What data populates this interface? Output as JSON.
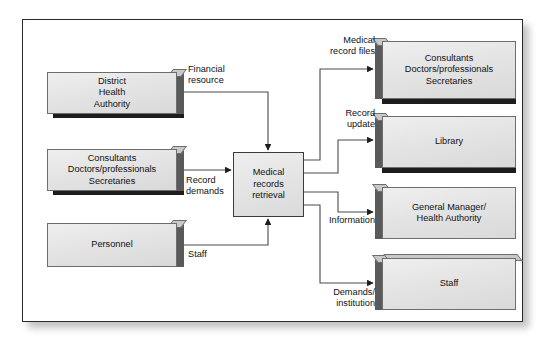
{
  "diagram": {
    "type": "data-flow-diagram",
    "frame": {
      "border_color": "#2b2b2b",
      "background": "#ffffff"
    },
    "palette": {
      "block_fill": "#e4e4e4",
      "block_border": "#6d6d6d",
      "block_shadow": "#1d1d1d",
      "block_side_shade": "#5a5a5a",
      "connector": "#3b3b3b",
      "text": "#111111"
    },
    "process": {
      "id": "medical-records-retrieval",
      "label": "Medical\nrecords\nretrieval",
      "shape": "rectangle"
    },
    "sources": [
      {
        "id": "district-health-authority",
        "label": "District\nHealth\nAuthority"
      },
      {
        "id": "consultants-doctors-secretaries-in",
        "label": "Consultants\nDoctors/professionals\nSecretaries"
      },
      {
        "id": "personnel",
        "label": "Personnel"
      }
    ],
    "sinks": [
      {
        "id": "consultants-doctors-secretaries-out",
        "label": "Consultants\nDoctors/professionals\nSecretaries"
      },
      {
        "id": "library",
        "label": "Library"
      },
      {
        "id": "general-manager-health-authority",
        "label": "General Manager/\nHealth Authority"
      },
      {
        "id": "staff",
        "label": "Staff"
      }
    ],
    "inflows": [
      {
        "id": "financial-resource",
        "label": "Financial\nresource",
        "from": "district-health-authority",
        "to": "medical-records-retrieval"
      },
      {
        "id": "record-demands",
        "label": "Record\ndemands",
        "from": "consultants-doctors-secretaries-in",
        "to": "medical-records-retrieval"
      },
      {
        "id": "staff-flow",
        "label": "Staff",
        "from": "personnel",
        "to": "medical-records-retrieval"
      }
    ],
    "outflows": [
      {
        "id": "medical-record-files",
        "label": "Medical\nrecord files",
        "from": "medical-records-retrieval",
        "to": "consultants-doctors-secretaries-out"
      },
      {
        "id": "record-update",
        "label": "Record\nupdate",
        "from": "medical-records-retrieval",
        "to": "library"
      },
      {
        "id": "information",
        "label": "Information",
        "from": "medical-records-retrieval",
        "to": "general-manager-health-authority"
      },
      {
        "id": "demands-institution",
        "label": "Demands/\ninstitution",
        "from": "medical-records-retrieval",
        "to": "staff"
      }
    ]
  }
}
